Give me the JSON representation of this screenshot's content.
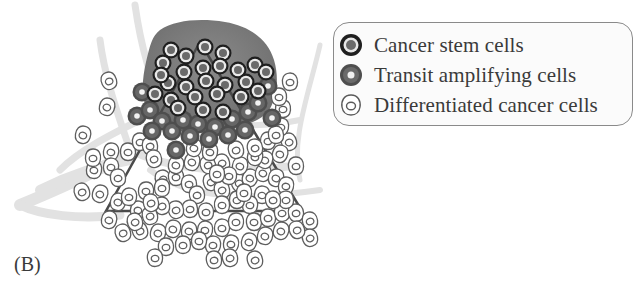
{
  "panel_label": "(B)",
  "legend": {
    "items": [
      {
        "label": "Cancer stem cells",
        "icon": "cancer-stem-cell-icon",
        "ring_color": "#1f1f1f",
        "fill_color": "#6a6a6a"
      },
      {
        "label": "Transit amplifying cells",
        "icon": "transit-amplifying-cell-icon",
        "ring_color": "#4a4a4a",
        "fill_color": "#e6e6e6"
      },
      {
        "label": "Differentiated cancer cells",
        "icon": "differentiated-cancer-cell-icon",
        "ring_color": "#5a5a5a",
        "fill_color": "#ffffff"
      }
    ]
  },
  "diagram": {
    "tumor_mass_color": "#7a7a7a",
    "vessel_color": "#dcdcdc",
    "hierarchy_triangle": {
      "apex": [
        200,
        42
      ],
      "bottom_left": [
        106,
        211
      ],
      "bottom_right": [
        302,
        211
      ],
      "stroke": "#4a4a4a"
    },
    "stem_cells": [
      [
        171,
        50
      ],
      [
        186,
        56
      ],
      [
        205,
        47
      ],
      [
        223,
        53
      ],
      [
        163,
        63
      ],
      [
        184,
        72
      ],
      [
        203,
        68
      ],
      [
        220,
        66
      ],
      [
        238,
        70
      ],
      [
        255,
        65
      ],
      [
        168,
        83
      ],
      [
        186,
        87
      ],
      [
        206,
        81
      ],
      [
        225,
        85
      ],
      [
        246,
        82
      ],
      [
        171,
        100
      ],
      [
        195,
        97
      ],
      [
        217,
        94
      ],
      [
        241,
        97
      ],
      [
        266,
        72
      ],
      [
        161,
        75
      ],
      [
        178,
        108
      ],
      [
        203,
        110
      ],
      [
        223,
        112
      ],
      [
        258,
        91
      ],
      [
        155,
        94
      ]
    ],
    "transit_cells": [
      [
        142,
        92
      ],
      [
        137,
        116
      ],
      [
        150,
        110
      ],
      [
        162,
        121
      ],
      [
        172,
        131
      ],
      [
        183,
        120
      ],
      [
        198,
        124
      ],
      [
        215,
        127
      ],
      [
        232,
        119
      ],
      [
        248,
        112
      ],
      [
        258,
        103
      ],
      [
        268,
        86
      ],
      [
        272,
        118
      ],
      [
        176,
        150
      ],
      [
        190,
        136
      ],
      [
        152,
        131
      ],
      [
        245,
        130
      ],
      [
        228,
        135
      ],
      [
        209,
        139
      ]
    ],
    "differentiated_cells": [
      [
        109,
        81
      ],
      [
        107,
        107
      ],
      [
        83,
        135
      ],
      [
        111,
        152
      ],
      [
        94,
        170
      ],
      [
        111,
        167
      ],
      [
        93,
        158
      ],
      [
        128,
        152
      ],
      [
        140,
        142
      ],
      [
        118,
        178
      ],
      [
        150,
        146
      ],
      [
        154,
        159
      ],
      [
        163,
        179
      ],
      [
        82,
        192
      ],
      [
        100,
        194
      ],
      [
        118,
        202
      ],
      [
        109,
        220
      ],
      [
        138,
        210
      ],
      [
        129,
        197
      ],
      [
        146,
        191
      ],
      [
        162,
        188
      ],
      [
        176,
        177
      ],
      [
        189,
        184
      ],
      [
        197,
        195
      ],
      [
        211,
        182
      ],
      [
        222,
        190
      ],
      [
        239,
        183
      ],
      [
        250,
        178
      ],
      [
        263,
        173
      ],
      [
        276,
        178
      ],
      [
        286,
        186
      ],
      [
        262,
        195
      ],
      [
        250,
        205
      ],
      [
        237,
        200
      ],
      [
        222,
        205
      ],
      [
        206,
        212
      ],
      [
        190,
        209
      ],
      [
        176,
        210
      ],
      [
        162,
        206
      ],
      [
        150,
        216
      ],
      [
        140,
        231
      ],
      [
        158,
        233
      ],
      [
        173,
        229
      ],
      [
        189,
        231
      ],
      [
        205,
        230
      ],
      [
        222,
        228
      ],
      [
        236,
        222
      ],
      [
        254,
        222
      ],
      [
        268,
        218
      ],
      [
        282,
        213
      ],
      [
        296,
        213
      ],
      [
        310,
        221
      ],
      [
        310,
        238
      ],
      [
        297,
        230
      ],
      [
        281,
        231
      ],
      [
        265,
        236
      ],
      [
        249,
        242
      ],
      [
        231,
        244
      ],
      [
        213,
        245
      ],
      [
        199,
        241
      ],
      [
        183,
        245
      ],
      [
        166,
        247
      ],
      [
        155,
        258
      ],
      [
        214,
        260
      ],
      [
        230,
        258
      ],
      [
        255,
        260
      ],
      [
        289,
        142
      ],
      [
        280,
        154
      ],
      [
        265,
        160
      ],
      [
        240,
        166
      ],
      [
        255,
        157
      ],
      [
        281,
        127
      ],
      [
        268,
        141
      ],
      [
        283,
        109
      ],
      [
        279,
        97
      ],
      [
        290,
        82
      ],
      [
        276,
        135
      ],
      [
        255,
        148
      ],
      [
        236,
        150
      ],
      [
        222,
        163
      ],
      [
        208,
        165
      ],
      [
        192,
        162
      ],
      [
        176,
        165
      ],
      [
        194,
        148
      ],
      [
        210,
        152
      ],
      [
        229,
        176
      ],
      [
        244,
        193
      ],
      [
        217,
        174
      ],
      [
        296,
        166
      ],
      [
        286,
        200
      ],
      [
        273,
        200
      ],
      [
        151,
        203
      ],
      [
        135,
        222
      ],
      [
        123,
        233
      ]
    ]
  }
}
